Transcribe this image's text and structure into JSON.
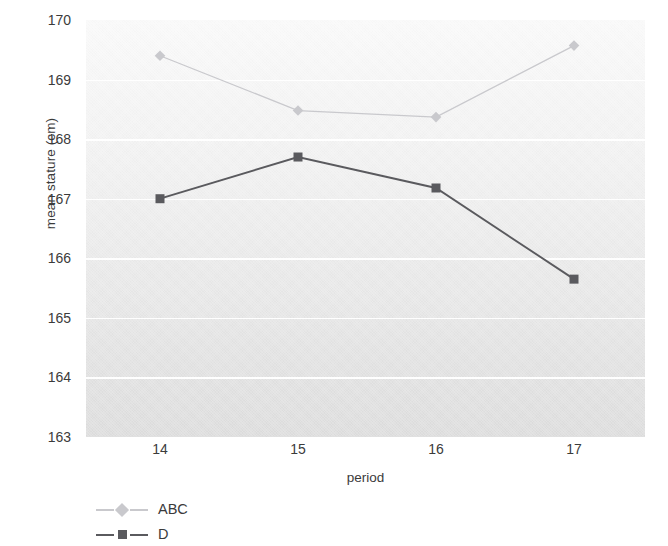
{
  "chart_data": {
    "type": "line",
    "title": "",
    "xlabel": "period",
    "ylabel": "mean stature (cm)",
    "x": [
      14,
      15,
      16,
      17
    ],
    "categories": [
      "14",
      "15",
      "16",
      "17"
    ],
    "xtick_labels": [
      "14",
      "15",
      "16",
      "17"
    ],
    "ytick_labels": [
      "170",
      "169",
      "168",
      "167",
      "166",
      "165",
      "164",
      "163"
    ],
    "ylim": [
      163,
      170
    ],
    "ytick_values": [
      170,
      169,
      168,
      167,
      166,
      165,
      164,
      163
    ],
    "grid": "horizontal-white-gridlines",
    "legend_position": "below-plot-left",
    "series": [
      {
        "name": "ABC",
        "marker": "diamond",
        "color": "#c9c9cd",
        "values": [
          169.4,
          168.48,
          168.37,
          169.57
        ]
      },
      {
        "name": "D",
        "marker": "square",
        "color": "#5a5a5e",
        "values": [
          167.0,
          167.7,
          167.18,
          165.65
        ]
      }
    ]
  },
  "axes": {
    "y_title": "mean stature (cm)",
    "x_title": "period"
  },
  "legend": {
    "items": [
      {
        "label": "ABC",
        "color": "#c9c9cd",
        "marker": "diamond"
      },
      {
        "label": "D",
        "color": "#5a5a5e",
        "marker": "square"
      }
    ]
  },
  "colors": {
    "series_abc": "#c9c9cd",
    "series_d": "#5a5a5e",
    "text": "#3b3b3b",
    "gridline": "#ffffff",
    "plot_background": "#ededed"
  }
}
